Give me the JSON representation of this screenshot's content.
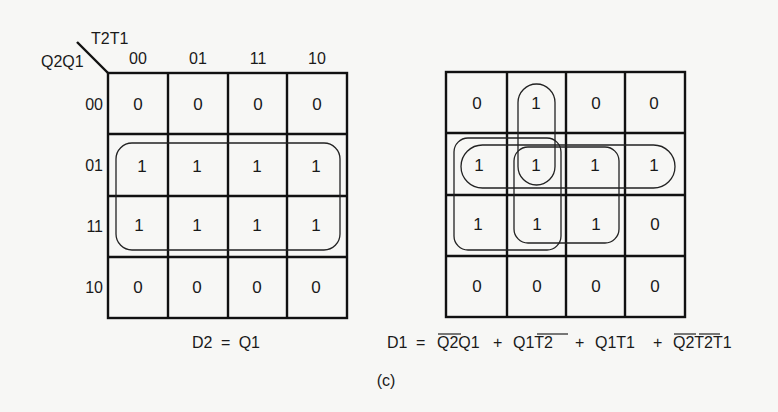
{
  "figure": {
    "caption": "(c)",
    "maps": [
      {
        "id": "d2",
        "row_var": "Q2Q1",
        "col_var": "T2T1",
        "col_headers": [
          "00",
          "01",
          "11",
          "10"
        ],
        "row_headers": [
          "00",
          "01",
          "11",
          "10"
        ],
        "cells": [
          [
            "0",
            "0",
            "0",
            "0"
          ],
          [
            "1",
            "1",
            "1",
            "1"
          ],
          [
            "1",
            "1",
            "1",
            "1"
          ],
          [
            "0",
            "0",
            "0",
            "0"
          ]
        ],
        "groups": [
          {
            "term": "Q1",
            "rows": [
              "01",
              "11"
            ],
            "cols": [
              "00",
              "01",
              "11",
              "10"
            ]
          }
        ],
        "equation": {
          "lhs": "D2",
          "eq": "=",
          "rhs": "Q1"
        }
      },
      {
        "id": "d1",
        "cells": [
          [
            "0",
            "1",
            "0",
            "0"
          ],
          [
            "1",
            "1",
            "1",
            "1"
          ],
          [
            "1",
            "1",
            "1",
            "0"
          ],
          [
            "0",
            "0",
            "0",
            "0"
          ]
        ],
        "groups": [
          {
            "term": "Q̄2Q1",
            "rows": [
              "01"
            ],
            "cols": [
              "00",
              "01",
              "11",
              "10"
            ]
          },
          {
            "term": "Q1T̄2",
            "rows": [
              "01",
              "11"
            ],
            "cols": [
              "00",
              "01"
            ]
          },
          {
            "term": "Q1T1",
            "rows": [
              "01",
              "11"
            ],
            "cols": [
              "01",
              "11"
            ]
          },
          {
            "term": "Q̄2T̄2T1",
            "rows": [
              "00",
              "01"
            ],
            "cols": [
              "01"
            ]
          }
        ],
        "equation": {
          "lhs": "D1",
          "eq": "=",
          "terms": [
            {
              "parts": [
                {
                  "t": "Q2",
                  "bar": true
                },
                {
                  "t": "Q1",
                  "bar": false
                }
              ]
            },
            {
              "parts": [
                {
                  "t": "Q1",
                  "bar": false
                },
                {
                  "t": "T2",
                  "bar": true
                }
              ]
            },
            {
              "parts": [
                {
                  "t": "Q1",
                  "bar": false
                },
                {
                  "t": "T1",
                  "bar": false
                }
              ]
            },
            {
              "parts": [
                {
                  "t": "Q2",
                  "bar": true
                },
                {
                  "t": "T2",
                  "bar": true
                },
                {
                  "t": "T1",
                  "bar": false
                }
              ]
            }
          ],
          "plus": "+"
        }
      }
    ]
  }
}
